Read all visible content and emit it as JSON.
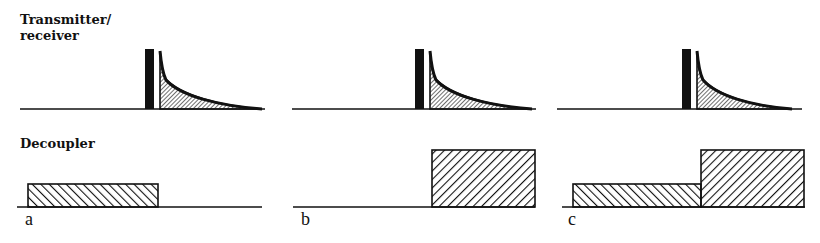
{
  "labels": {
    "transmitter_line1": "Transmitter/",
    "transmitter_line2": "receiver",
    "decoupler": "Decoupler"
  },
  "panels": [
    {
      "letter": "a",
      "decoupler": "low power during receive only"
    },
    {
      "letter": "b",
      "decoupler": "high power during receive only"
    },
    {
      "letter": "c",
      "decoupler": "low power during transmit, high power during receive"
    }
  ],
  "colors": {
    "ink": "#111111",
    "background": "#ffffff"
  }
}
